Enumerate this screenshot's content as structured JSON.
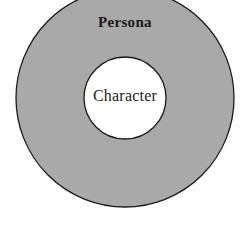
{
  "diagram": {
    "type": "concentric-circles",
    "outer": {
      "label": "Persona",
      "fill": "#a9a9a9",
      "stroke": "#1a1a1a"
    },
    "inner": {
      "label": "Character",
      "fill": "#ffffff",
      "stroke": "#1a1a1a"
    }
  }
}
